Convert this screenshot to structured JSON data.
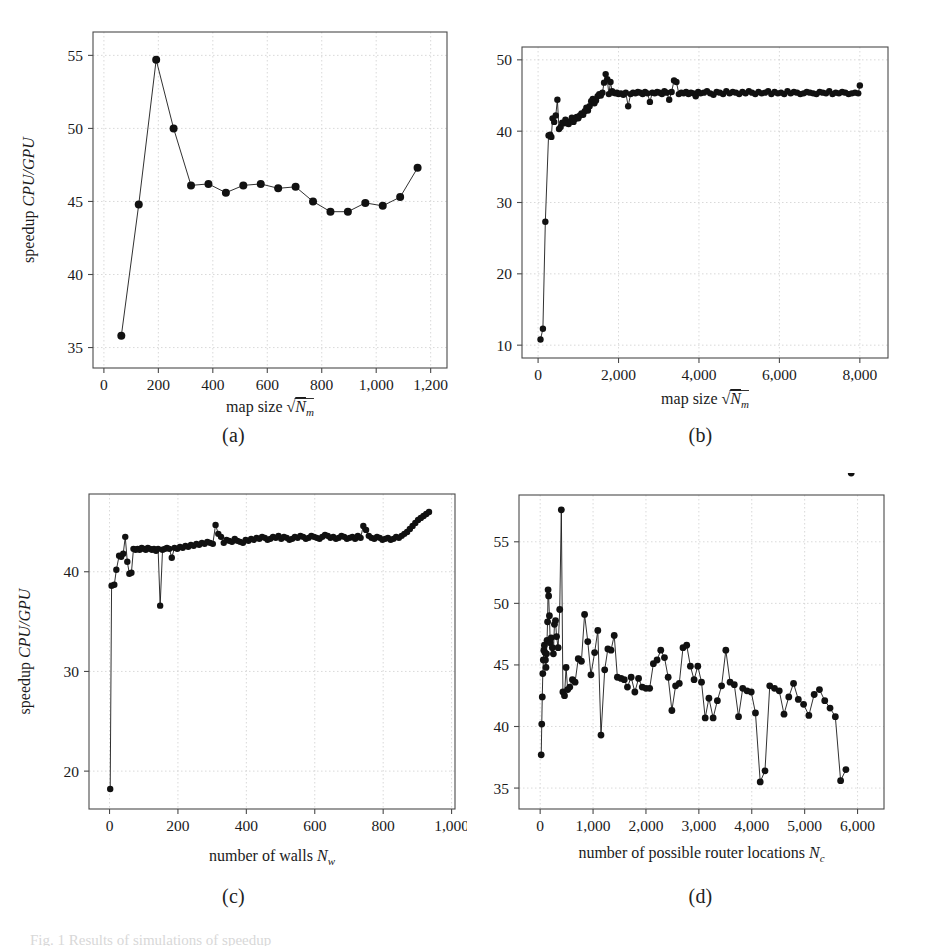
{
  "figure": {
    "caption": "Fig. 1 Results of simulations of speedup",
    "axis_label_y": "speedup ",
    "axis_label_y_italic": "CPU/GPU"
  },
  "panels": [
    {
      "id": "a",
      "subcaption": "(a)",
      "xlabel_text": "map size ",
      "xlabel_math": "√Nₘ",
      "ylabel_text": "speedup ",
      "ylabel_math": "CPU/GPU",
      "xticks": [
        "0",
        "200",
        "400",
        "600",
        "800",
        "1,000",
        "1,200"
      ],
      "yticks": [
        "35",
        "40",
        "45",
        "50",
        "55"
      ]
    },
    {
      "id": "b",
      "subcaption": "(b)",
      "xlabel_text": "map size ",
      "xlabel_math": "√Nₘ",
      "ylabel_text": "",
      "ylabel_math": "",
      "xticks": [
        "0",
        "2,000",
        "4,000",
        "6,000",
        "8,000"
      ],
      "yticks": [
        "10",
        "20",
        "30",
        "40",
        "50"
      ]
    },
    {
      "id": "c",
      "subcaption": "(c)",
      "xlabel_text": "number of walls ",
      "xlabel_math": "Nᵥ",
      "ylabel_text": "speedup ",
      "ylabel_math": "CPU/GPU",
      "xticks": [
        "0",
        "200",
        "400",
        "600",
        "800",
        "1,000"
      ],
      "yticks": [
        "20",
        "30",
        "40"
      ]
    },
    {
      "id": "d",
      "subcaption": "(d)",
      "xlabel_text": "number of possible router locations ",
      "xlabel_math": "Nᴄ",
      "ylabel_text": "",
      "ylabel_math": "",
      "xticks": [
        "0",
        "1,000",
        "2,000",
        "3,000",
        "4,000",
        "5,000",
        "6,000"
      ],
      "yticks": [
        "35",
        "40",
        "45",
        "50",
        "55"
      ]
    }
  ],
  "chart_data": [
    {
      "type": "line",
      "panel": "a",
      "title": "(a)",
      "xlabel": "map size sqrt(N_m)",
      "ylabel": "speedup CPU/GPU",
      "xlim": [
        -40,
        1260
      ],
      "ylim": [
        33.6,
        56.6
      ],
      "grid": true,
      "legend": "none",
      "marker": "filled-circle",
      "x": [
        64,
        128,
        192,
        256,
        320,
        384,
        448,
        512,
        576,
        640,
        704,
        768,
        832,
        896,
        960,
        1024,
        1088,
        1152
      ],
      "y": [
        35.8,
        44.8,
        54.7,
        50.0,
        46.1,
        46.2,
        45.6,
        46.1,
        46.2,
        45.9,
        46.0,
        45.0,
        44.3,
        44.3,
        44.9,
        44.7,
        45.3,
        47.3
      ]
    },
    {
      "type": "line",
      "panel": "b",
      "title": "(b)",
      "xlabel": "map size sqrt(N_m)",
      "ylabel": "speedup CPU/GPU",
      "xlim": [
        -400,
        8700
      ],
      "ylim": [
        8.2,
        51.8
      ],
      "grid": true,
      "legend": "none",
      "marker": "filled-circle",
      "x": [
        60,
        120,
        180,
        260,
        300,
        330,
        360,
        400,
        440,
        480,
        520,
        560,
        600,
        640,
        680,
        720,
        760,
        800,
        840,
        880,
        920,
        960,
        1000,
        1040,
        1080,
        1120,
        1160,
        1200,
        1240,
        1280,
        1320,
        1360,
        1400,
        1440,
        1480,
        1520,
        1560,
        1600,
        1640,
        1680,
        1720,
        1760,
        1800,
        1840,
        1880,
        1920,
        1960,
        2000,
        2060,
        2120,
        2180,
        2240,
        2300,
        2360,
        2420,
        2480,
        2540,
        2600,
        2660,
        2720,
        2780,
        2840,
        2900,
        2960,
        3020,
        3080,
        3140,
        3200,
        3260,
        3320,
        3380,
        3440,
        3500,
        3560,
        3620,
        3680,
        3740,
        3800,
        3860,
        3920,
        3980,
        4040,
        4120,
        4200,
        4280,
        4360,
        4440,
        4520,
        4600,
        4680,
        4760,
        4840,
        4920,
        5000,
        5080,
        5160,
        5240,
        5320,
        5400,
        5480,
        5560,
        5640,
        5720,
        5800,
        5880,
        5960,
        6040,
        6120,
        6200,
        6280,
        6360,
        6440,
        6520,
        6600,
        6680,
        6760,
        6840,
        6920,
        7000,
        7080,
        7160,
        7240,
        7320,
        7400,
        7480,
        7560,
        7640,
        7720,
        7800,
        7880,
        7960,
        8000
      ],
      "y": [
        10.8,
        12.3,
        27.3,
        39.4,
        39.5,
        39.2,
        41.8,
        41.3,
        42.2,
        44.4,
        40.3,
        40.6,
        41.2,
        41.1,
        41.6,
        41.1,
        41.0,
        41.4,
        41.9,
        41.3,
        41.7,
        42.0,
        41.8,
        42.2,
        42.5,
        42.3,
        42.8,
        43.3,
        42.9,
        43.5,
        44.2,
        44.5,
        43.9,
        44.3,
        44.9,
        45.2,
        45.0,
        45.4,
        46.8,
        48.0,
        47.3,
        45.2,
        46.9,
        45.6,
        45.4,
        45.3,
        45.4,
        45.2,
        45.3,
        45.1,
        45.4,
        43.5,
        45.2,
        45.4,
        45.3,
        45.5,
        45.4,
        45.2,
        45.5,
        45.3,
        44.1,
        45.4,
        45.3,
        45.5,
        45.4,
        45.2,
        45.6,
        45.4,
        44.4,
        45.5,
        47.1,
        46.9,
        45.2,
        45.4,
        45.3,
        45.5,
        45.2,
        45.4,
        45.3,
        44.9,
        45.5,
        45.3,
        45.4,
        45.6,
        45.3,
        45.1,
        45.5,
        45.4,
        45.2,
        45.6,
        45.3,
        45.5,
        45.4,
        45.2,
        45.5,
        45.3,
        45.6,
        45.4,
        45.2,
        45.5,
        45.3,
        45.4,
        45.6,
        45.2,
        45.5,
        45.3,
        45.4,
        45.2,
        45.6,
        45.3,
        45.5,
        45.4,
        45.2,
        45.3,
        45.5,
        45.4,
        45.3,
        45.2,
        45.5,
        45.4,
        45.3,
        45.6,
        45.2,
        45.4,
        45.3,
        45.5,
        45.4,
        45.2,
        45.3,
        45.4,
        45.3,
        46.4
      ]
    },
    {
      "type": "line",
      "panel": "c",
      "title": "(c)",
      "xlabel": "number of walls N_w",
      "ylabel": "speedup CPU/GPU",
      "xlim": [
        -60,
        1010
      ],
      "ylim": [
        16.2,
        47.8
      ],
      "grid": true,
      "legend": "none",
      "marker": "filled-circle",
      "x": [
        2,
        6,
        14,
        20,
        28,
        34,
        40,
        46,
        52,
        58,
        64,
        70,
        76,
        82,
        88,
        94,
        100,
        106,
        112,
        118,
        124,
        130,
        136,
        142,
        148,
        155,
        162,
        168,
        175,
        182,
        190,
        198,
        206,
        214,
        222,
        230,
        238,
        246,
        254,
        262,
        270,
        278,
        286,
        294,
        302,
        310,
        318,
        326,
        334,
        342,
        350,
        358,
        366,
        374,
        382,
        390,
        398,
        406,
        414,
        422,
        430,
        438,
        446,
        454,
        462,
        470,
        478,
        486,
        494,
        502,
        510,
        518,
        526,
        534,
        542,
        550,
        558,
        566,
        574,
        582,
        590,
        598,
        606,
        614,
        622,
        630,
        638,
        646,
        654,
        662,
        670,
        678,
        686,
        694,
        702,
        710,
        718,
        726,
        734,
        742,
        750,
        758,
        766,
        774,
        782,
        790,
        798,
        806,
        814,
        822,
        830,
        838,
        846,
        854,
        862,
        870,
        878,
        886,
        894,
        902,
        910,
        918,
        926,
        934
      ],
      "y": [
        18.2,
        38.6,
        38.7,
        40.2,
        41.6,
        41.5,
        41.8,
        43.5,
        41.0,
        39.8,
        39.9,
        42.3,
        42.2,
        42.3,
        42.2,
        42.4,
        42.3,
        42.2,
        42.4,
        42.3,
        42.2,
        42.3,
        42.1,
        42.3,
        36.6,
        42.2,
        42.3,
        42.4,
        42.3,
        41.4,
        42.4,
        42.3,
        42.5,
        42.4,
        42.6,
        42.5,
        42.7,
        42.6,
        42.8,
        42.7,
        42.9,
        42.8,
        43.0,
        42.9,
        42.8,
        44.7,
        43.8,
        43.5,
        42.9,
        43.2,
        43.1,
        43.0,
        43.3,
        43.1,
        43.0,
        42.9,
        43.2,
        43.1,
        43.3,
        43.2,
        43.4,
        43.3,
        43.5,
        43.4,
        43.2,
        43.3,
        43.5,
        43.4,
        43.6,
        43.3,
        43.5,
        43.4,
        43.2,
        43.3,
        43.5,
        43.4,
        43.6,
        43.5,
        43.3,
        43.4,
        43.6,
        43.5,
        43.4,
        43.3,
        43.5,
        43.7,
        43.6,
        43.4,
        43.5,
        43.3,
        43.4,
        43.6,
        43.5,
        43.3,
        43.4,
        43.5,
        43.3,
        43.6,
        43.4,
        44.6,
        44.2,
        43.6,
        43.4,
        43.3,
        43.5,
        43.4,
        43.2,
        43.3,
        43.4,
        43.2,
        43.3,
        43.5,
        43.4,
        43.6,
        43.8,
        44.0,
        44.3,
        44.6,
        44.9,
        45.2,
        45.4,
        45.6,
        45.8,
        46.0
      ]
    },
    {
      "type": "line",
      "panel": "d",
      "title": "(d)",
      "xlabel": "number of possible router locations N_c",
      "ylabel": "speedup CPU/GPU",
      "xlim": [
        -400,
        6500
      ],
      "ylim": [
        33.3,
        58.8
      ],
      "grid": true,
      "legend": "none",
      "marker": "filled-circle",
      "x": [
        20,
        30,
        40,
        50,
        60,
        70,
        80,
        90,
        100,
        110,
        120,
        130,
        140,
        150,
        160,
        175,
        190,
        210,
        230,
        250,
        270,
        290,
        310,
        340,
        370,
        400,
        430,
        460,
        490,
        520,
        560,
        610,
        660,
        720,
        780,
        840,
        900,
        960,
        1030,
        1090,
        1150,
        1220,
        1280,
        1340,
        1400,
        1460,
        1530,
        1590,
        1650,
        1720,
        1790,
        1860,
        1930,
        2000,
        2070,
        2140,
        2210,
        2280,
        2350,
        2420,
        2490,
        2560,
        2630,
        2700,
        2770,
        2840,
        2910,
        2980,
        3050,
        3120,
        3190,
        3270,
        3350,
        3430,
        3510,
        3590,
        3670,
        3750,
        3830,
        3910,
        3990,
        4070,
        4160,
        4250,
        4340,
        4430,
        4520,
        4610,
        4700,
        4790,
        4880,
        4980,
        5080,
        5180,
        5280,
        5380,
        5480,
        5580,
        5680,
        5780,
        5880
      ],
      "y": [
        37.7,
        40.2,
        42.4,
        44.3,
        45.4,
        46.2,
        46.6,
        46.0,
        45.4,
        44.8,
        45.9,
        47.0,
        48.5,
        51.1,
        50.6,
        49.0,
        46.8,
        47.2,
        46.4,
        45.9,
        48.3,
        48.6,
        47.3,
        46.4,
        49.5,
        57.6,
        42.8,
        42.5,
        44.8,
        43.0,
        43.2,
        43.8,
        43.6,
        45.5,
        45.3,
        49.1,
        46.9,
        44.2,
        46.0,
        47.8,
        39.3,
        44.6,
        46.3,
        46.2,
        47.4,
        44.0,
        43.9,
        43.8,
        43.2,
        44.0,
        42.8,
        43.9,
        43.2,
        43.1,
        43.1,
        45.1,
        45.4,
        46.2,
        45.6,
        44.0,
        41.3,
        43.3,
        43.5,
        46.4,
        46.6,
        44.9,
        43.8,
        44.9,
        43.6,
        40.7,
        42.3,
        40.7,
        42.1,
        43.3,
        46.2,
        43.6,
        43.4,
        40.8,
        43.1,
        42.9,
        42.8,
        41.1,
        35.5,
        36.4,
        43.3,
        43.1,
        42.9,
        41.0,
        42.4,
        43.5,
        42.2,
        41.8,
        40.9,
        42.6,
        43.0,
        42.1,
        41.5,
        40.8,
        35.6,
        36.5
      ]
    }
  ]
}
